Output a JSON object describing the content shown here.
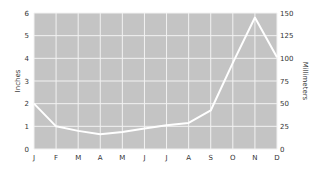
{
  "chart_data": {
    "type": "line",
    "title": "",
    "xlabel": "",
    "ylabel": "Inches",
    "ylabel_right": "Millimeters",
    "categories": [
      "J",
      "F",
      "M",
      "A",
      "M",
      "J",
      "J",
      "A",
      "S",
      "O",
      "N",
      "D"
    ],
    "series": [
      {
        "name": "Precipitation",
        "values": [
          2.0,
          1.0,
          0.8,
          0.65,
          0.75,
          0.9,
          1.05,
          1.15,
          1.7,
          3.8,
          5.8,
          4.05
        ]
      }
    ],
    "ylim": [
      0,
      6
    ],
    "yticks": [
      "0",
      "1",
      "2",
      "3",
      "4",
      "5",
      "6"
    ],
    "ylim_right": [
      0,
      150
    ],
    "yticks_right": [
      "0",
      "25",
      "50",
      "75",
      "100",
      "125",
      "150"
    ],
    "grid": true,
    "legend": "none",
    "colors": {
      "plot_background": "#c4c4c4",
      "grid": "#f2f2f2",
      "line": "#ffffff",
      "text": "#333333"
    }
  }
}
